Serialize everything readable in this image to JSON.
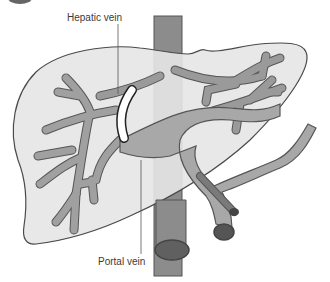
{
  "labels": {
    "hepatic_vein": "Hepatic vein",
    "portal_vein": "Portal vein"
  },
  "colors": {
    "liver_fill": "#e6e6e6",
    "liver_outline": "#4a4a4a",
    "vena_cava": "#8c8c8c",
    "portal_vein": "#a8a8a8",
    "hepatic_branches": "#9a9a9a",
    "artery": "#7a7a7a",
    "bile_duct": "#ffffff",
    "label_text": "#3a3a3a",
    "leader_line": "#555555"
  }
}
